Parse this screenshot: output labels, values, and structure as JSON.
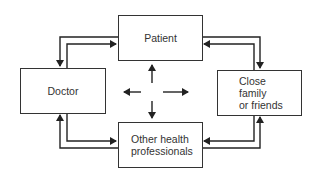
{
  "diagram": {
    "nodes": [
      {
        "id": "patient",
        "label": "Patient"
      },
      {
        "id": "doctor",
        "label": "Doctor"
      },
      {
        "id": "close-family",
        "label": "Close\nfamily\nor friends"
      },
      {
        "id": "other-health",
        "label": "Other health\nprofessionals"
      }
    ],
    "edges": [
      {
        "from": "patient",
        "to": "doctor"
      },
      {
        "from": "doctor",
        "to": "patient"
      },
      {
        "from": "patient",
        "to": "close-family"
      },
      {
        "from": "close-family",
        "to": "patient"
      },
      {
        "from": "doctor",
        "to": "other-health"
      },
      {
        "from": "other-health",
        "to": "doctor"
      },
      {
        "from": "close-family",
        "to": "other-health"
      },
      {
        "from": "other-health",
        "to": "close-family"
      }
    ],
    "center": {
      "arrows": [
        "up",
        "down",
        "left",
        "right"
      ]
    },
    "colors": {
      "line": "#222222",
      "box_border": "#333333",
      "text": "#333333"
    }
  }
}
